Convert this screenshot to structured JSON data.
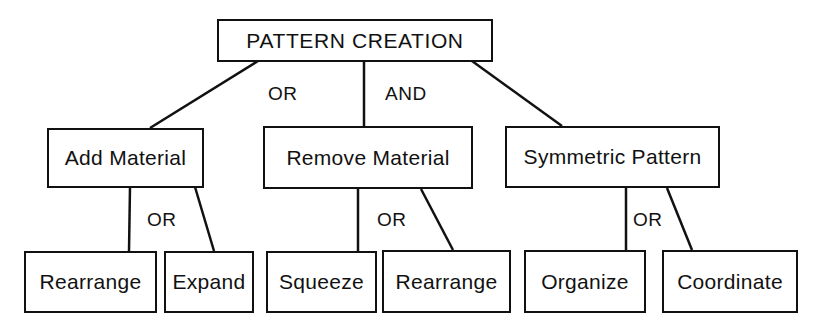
{
  "root": {
    "label": "PATTERN CREATION"
  },
  "root_connectors": {
    "left": "OR",
    "middle": "AND"
  },
  "level1": [
    {
      "label": "Add Material",
      "connector": "OR"
    },
    {
      "label": "Remove Material",
      "connector": "OR"
    },
    {
      "label": "Symmetric Pattern",
      "connector": "OR"
    }
  ],
  "level2": {
    "add_material": [
      {
        "label": "Rearrange"
      },
      {
        "label": "Expand"
      }
    ],
    "remove_material": [
      {
        "label": "Squeeze"
      },
      {
        "label": "Rearrange"
      }
    ],
    "symmetric_pattern": [
      {
        "label": "Organize"
      },
      {
        "label": "Coordinate"
      }
    ]
  },
  "colors": {
    "stroke": "#111111",
    "background": "#ffffff"
  }
}
